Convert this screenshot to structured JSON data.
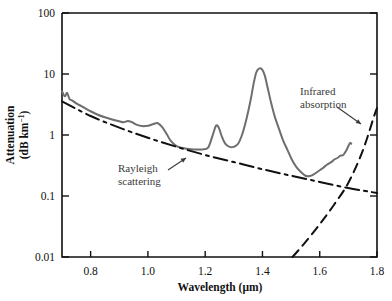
{
  "figure": {
    "background": "#ffffff",
    "frame_color": "#111111"
  },
  "axes": {
    "x": {
      "label_parts": {
        "main": "Wavelength (",
        "mu": "μ",
        "tail": "m)"
      },
      "label": "Wavelength (μm)",
      "ticks": [
        "0.8",
        "1.0",
        "1.2",
        "1.4",
        "1.6",
        "1.8"
      ],
      "tick_values": [
        0.8,
        1.0,
        1.2,
        1.4,
        1.6,
        1.8
      ],
      "range": [
        0.7,
        1.8
      ],
      "scale": "linear"
    },
    "y": {
      "label_line1": "Attenuation",
      "label_line2_main": "(dB km",
      "label_line2_sup": "−1",
      "label_line2_tail": ")",
      "label": "Attenuation (dB km−1)",
      "ticks": [
        "100",
        "10",
        "1",
        "0.1",
        "0.01"
      ],
      "tick_values": [
        100,
        10,
        1,
        0.1,
        0.01
      ],
      "range": [
        0.01,
        100
      ],
      "scale": "log"
    }
  },
  "annotations": [
    {
      "name": "rayleigh-scattering",
      "line1": "Rayleigh",
      "line2": "scattering",
      "text_x": 118,
      "text_y": 172,
      "arrow": {
        "x1": 168,
        "y1": 170,
        "x2": 186,
        "y2": 158
      }
    },
    {
      "name": "infrared-absorption",
      "line1": "Infrared",
      "line2": "absorption",
      "text_x": 300,
      "text_y": 95,
      "arrow": {
        "x1": 337,
        "y1": 107,
        "x2": 361,
        "y2": 124
      }
    }
  ],
  "chart_data": {
    "type": "line",
    "title": "",
    "xlabel": "Wavelength (μm)",
    "ylabel": "Attenuation (dB km−1)",
    "xlim": [
      0.7,
      1.8
    ],
    "ylim": [
      0.01,
      100
    ],
    "yscale": "log",
    "grid": false,
    "legend": "none",
    "series": [
      {
        "name": "Total fiber attenuation",
        "style": "solid",
        "color": "#6e6e6e",
        "width": 2.0,
        "points": [
          [
            0.7,
            5.2
          ],
          [
            0.71,
            4.3
          ],
          [
            0.718,
            4.9
          ],
          [
            0.726,
            3.9
          ],
          [
            0.735,
            3.7
          ],
          [
            0.75,
            3.3
          ],
          [
            0.775,
            2.85
          ],
          [
            0.8,
            2.45
          ],
          [
            0.825,
            2.15
          ],
          [
            0.85,
            1.95
          ],
          [
            0.875,
            1.8
          ],
          [
            0.9,
            1.68
          ],
          [
            0.915,
            1.62
          ],
          [
            0.93,
            1.7
          ],
          [
            0.945,
            1.62
          ],
          [
            0.96,
            1.48
          ],
          [
            0.98,
            1.4
          ],
          [
            1.0,
            1.42
          ],
          [
            1.02,
            1.52
          ],
          [
            1.035,
            1.56
          ],
          [
            1.05,
            1.35
          ],
          [
            1.065,
            1.05
          ],
          [
            1.08,
            0.8
          ],
          [
            1.1,
            0.66
          ],
          [
            1.13,
            0.6
          ],
          [
            1.16,
            0.58
          ],
          [
            1.19,
            0.58
          ],
          [
            1.21,
            0.62
          ],
          [
            1.225,
            0.95
          ],
          [
            1.238,
            1.42
          ],
          [
            1.248,
            1.3
          ],
          [
            1.258,
            0.95
          ],
          [
            1.27,
            0.72
          ],
          [
            1.285,
            0.64
          ],
          [
            1.3,
            0.64
          ],
          [
            1.315,
            0.72
          ],
          [
            1.33,
            1.05
          ],
          [
            1.345,
            1.9
          ],
          [
            1.358,
            3.6
          ],
          [
            1.368,
            6.5
          ],
          [
            1.378,
            10.5
          ],
          [
            1.388,
            12.3
          ],
          [
            1.398,
            12.0
          ],
          [
            1.408,
            9.5
          ],
          [
            1.418,
            6.0
          ],
          [
            1.43,
            3.4
          ],
          [
            1.443,
            2.0
          ],
          [
            1.458,
            1.25
          ],
          [
            1.472,
            0.82
          ],
          [
            1.488,
            0.56
          ],
          [
            1.502,
            0.4
          ],
          [
            1.518,
            0.3
          ],
          [
            1.535,
            0.245
          ],
          [
            1.55,
            0.215
          ],
          [
            1.565,
            0.212
          ],
          [
            1.58,
            0.228
          ],
          [
            1.595,
            0.255
          ],
          [
            1.61,
            0.285
          ],
          [
            1.625,
            0.325
          ],
          [
            1.64,
            0.36
          ],
          [
            1.652,
            0.4
          ],
          [
            1.662,
            0.42
          ],
          [
            1.672,
            0.46
          ],
          [
            1.682,
            0.47
          ],
          [
            1.692,
            0.55
          ],
          [
            1.7,
            0.66
          ],
          [
            1.706,
            0.74
          ],
          [
            1.71,
            0.72
          ]
        ]
      },
      {
        "name": "Rayleigh scattering",
        "style": "dash-dot",
        "color": "#111111",
        "width": 2.0,
        "points": [
          [
            0.7,
            3.55
          ],
          [
            0.8,
            2.05
          ],
          [
            0.9,
            1.32
          ],
          [
            1.0,
            0.9
          ],
          [
            1.1,
            0.64
          ],
          [
            1.2,
            0.47
          ],
          [
            1.3,
            0.36
          ],
          [
            1.4,
            0.275
          ],
          [
            1.5,
            0.215
          ],
          [
            1.6,
            0.17
          ],
          [
            1.7,
            0.135
          ],
          [
            1.8,
            0.112
          ]
        ]
      },
      {
        "name": "Infrared absorption",
        "style": "dashed",
        "color": "#111111",
        "width": 2.0,
        "points": [
          [
            1.505,
            0.01
          ],
          [
            1.55,
            0.0175
          ],
          [
            1.6,
            0.0345
          ],
          [
            1.65,
            0.072
          ],
          [
            1.7,
            0.165
          ],
          [
            1.75,
            0.55
          ],
          [
            1.79,
            2.05
          ],
          [
            1.8,
            2.75
          ]
        ]
      }
    ]
  }
}
